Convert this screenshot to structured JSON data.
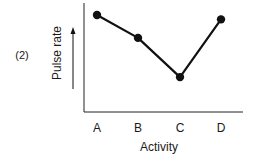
{
  "figure": {
    "label": "(2)"
  },
  "chart_data": {
    "type": "line",
    "title": "",
    "xlabel": "Activity",
    "ylabel": "Pulse rate",
    "categories": [
      "A",
      "B",
      "C",
      "D"
    ],
    "values": [
      8.9,
      6.8,
      3.2,
      8.5
    ],
    "ylim": [
      0,
      10
    ],
    "y_ticks": "none (qualitative axis with upward arrow)",
    "grid": false,
    "legend": "none",
    "markers": "filled circles",
    "line_color": "#111111"
  }
}
